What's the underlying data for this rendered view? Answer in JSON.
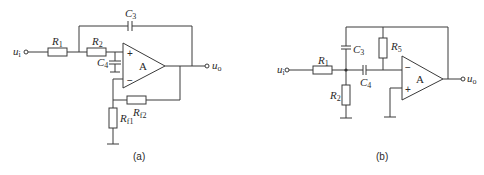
{
  "figure": {
    "panels": [
      {
        "id": "a",
        "caption": "(a)",
        "input_label": "u",
        "input_sub": "i",
        "output_label": "u",
        "output_sub": "o",
        "opamp_label": "A",
        "plus_sign": "+",
        "minus_sign": "−",
        "components": {
          "R1": {
            "letter": "R",
            "sub": "1"
          },
          "R2": {
            "letter": "R",
            "sub": "2"
          },
          "C3": {
            "letter": "C",
            "sub": "3"
          },
          "C4": {
            "letter": "C",
            "sub": "4"
          },
          "Rf1": {
            "letter": "R",
            "sub": "f1"
          },
          "Rf2": {
            "letter": "R",
            "sub": "f2"
          }
        }
      },
      {
        "id": "b",
        "caption": "(b)",
        "input_label": "u",
        "input_sub": "i",
        "output_label": "u",
        "output_sub": "o",
        "opamp_label": "A",
        "plus_sign": "+",
        "minus_sign": "−",
        "components": {
          "R1": {
            "letter": "R",
            "sub": "1"
          },
          "R2": {
            "letter": "R",
            "sub": "2"
          },
          "C3": {
            "letter": "C",
            "sub": "3"
          },
          "C4": {
            "letter": "C",
            "sub": "4"
          },
          "R5": {
            "letter": "R",
            "sub": "5"
          }
        }
      }
    ],
    "colors": {
      "line": "#3a3a3a",
      "text": "#2a2a2a",
      "background": "#ffffff"
    }
  }
}
